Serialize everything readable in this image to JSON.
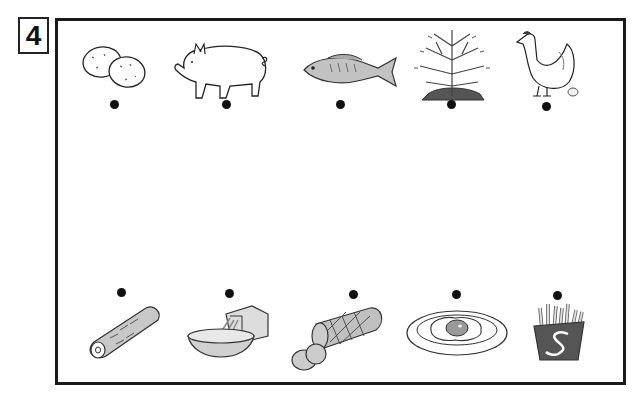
{
  "exercise": {
    "number": "4",
    "instruction_type": "matching-lines"
  },
  "top_row": [
    {
      "id": "potatoes",
      "label": "potatoes",
      "dot": {
        "x": 115,
        "y": 104
      }
    },
    {
      "id": "pig",
      "label": "pig",
      "dot": {
        "x": 227,
        "y": 104
      }
    },
    {
      "id": "fish",
      "label": "fish",
      "dot": {
        "x": 341,
        "y": 104
      }
    },
    {
      "id": "cinnamon-tree",
      "label": "tree",
      "dot": {
        "x": 452,
        "y": 104
      }
    },
    {
      "id": "hen",
      "label": "hen",
      "dot": {
        "x": 546,
        "y": 106
      }
    }
  ],
  "bottom_row": [
    {
      "id": "cinnamon-stick",
      "label": "cinnamon stick",
      "dot": {
        "x": 122,
        "y": 292
      }
    },
    {
      "id": "grated-cheese",
      "label": "grated ingredient in bowl",
      "dot": {
        "x": 229,
        "y": 293
      }
    },
    {
      "id": "ham",
      "label": "ham / sausage",
      "dot": {
        "x": 353,
        "y": 294
      }
    },
    {
      "id": "fried-egg",
      "label": "fried egg",
      "dot": {
        "x": 456,
        "y": 294
      }
    },
    {
      "id": "french-fries",
      "label": "french fries",
      "dot": {
        "x": 558,
        "y": 295
      }
    }
  ],
  "colors": {
    "frame": "#1a1a1a",
    "ink": "#222222",
    "fill_gray": "#b5b5b5",
    "dark_gray": "#555555"
  }
}
